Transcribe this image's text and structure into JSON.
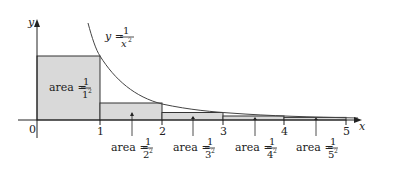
{
  "diagram": {
    "function_label": {
      "lhs": "y =",
      "num": "1",
      "den": "x",
      "exp": "2"
    },
    "axes": {
      "x_label": "x",
      "y_label": "y",
      "origin_label": "0"
    },
    "x_ticks": [
      "1",
      "2",
      "3",
      "4",
      "5"
    ],
    "rectangles": [
      {
        "label": "area =",
        "num": "1",
        "den": "1",
        "exp": "2"
      },
      {
        "label": "area =",
        "num": "1",
        "den": "2",
        "exp": "2"
      },
      {
        "label": "area =",
        "num": "1",
        "den": "3",
        "exp": "2"
      },
      {
        "label": "area =",
        "num": "1",
        "den": "4",
        "exp": "2"
      },
      {
        "label": "area =",
        "num": "1",
        "den": "5",
        "exp": "2"
      }
    ],
    "colors": {
      "fill": "#d9d9d9",
      "stroke": "#333333",
      "curve": "#444444"
    }
  }
}
